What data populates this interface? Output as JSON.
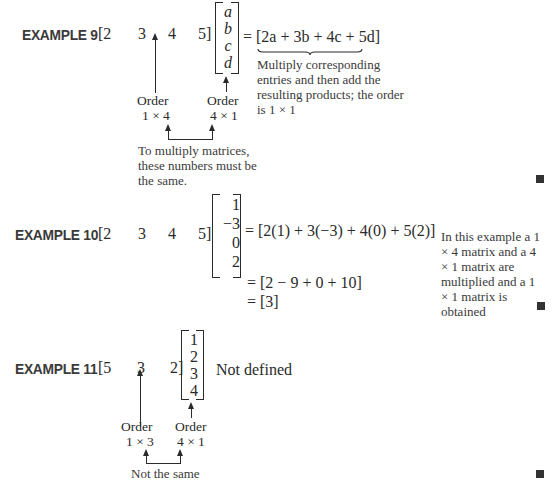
{
  "examples": [
    {
      "label": "EXAMPLE 9",
      "row_matrix": [
        "[2",
        "3",
        "4",
        "5]"
      ],
      "col_matrix": [
        "a",
        "b",
        "c",
        "d"
      ],
      "result": "= [2a + 3b + 4c + 5d]",
      "side_note": "Multiply corresponding entries and then add the resulting products; the order is 1 × 1",
      "order_left": {
        "title": "Order",
        "dims": "1 × 4"
      },
      "order_right": {
        "title": "Order",
        "dims": "4 × 1"
      },
      "bottom_note": "To multiply matrices, these numbers must be the same."
    },
    {
      "label": "EXAMPLE 10",
      "row_matrix": [
        "[2",
        "3",
        "4",
        "5]"
      ],
      "col_matrix": [
        "1",
        "−3",
        "0",
        "2"
      ],
      "result_lines": [
        "= [2(1) + 3(−3) + 4(0) + 5(2)]",
        "= [2 − 9 + 0 + 10]",
        "= [3]"
      ],
      "side_note": "In this example a 1 × 4 matrix and a 4 × 1 matrix are multiplied and a 1 × 1 matrix is obtained"
    },
    {
      "label": "EXAMPLE 11",
      "row_matrix": [
        "[5",
        "3",
        "2]"
      ],
      "col_matrix": [
        "1",
        "2",
        "3",
        "4"
      ],
      "result": "Not defined",
      "order_left": {
        "title": "Order",
        "dims": "1 × 3"
      },
      "order_right": {
        "title": "Order",
        "dims": "4 × 1"
      },
      "bottom_note": "Not the same"
    }
  ],
  "end_marker_color": "#333333"
}
